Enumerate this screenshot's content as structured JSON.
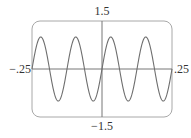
{
  "chart_data": {
    "type": "line",
    "title": "",
    "xlabel": "",
    "ylabel": "",
    "function": "y = sin(16*pi*x)",
    "xlim": [
      -0.25,
      0.25
    ],
    "ylim": [
      -1.5,
      1.5
    ],
    "grid": false,
    "legend": null,
    "tick_labels": {
      "x_min": "−.25",
      "x_max": ".25",
      "y_min": "−1.5",
      "y_max": "1.5"
    },
    "series": [
      {
        "name": "sine wave",
        "amplitude": 1,
        "period": 0.125,
        "cycles_shown": 4,
        "x": [
          -0.25,
          -0.21875,
          -0.1875,
          -0.15625,
          -0.125,
          -0.09375,
          -0.0625,
          -0.03125,
          0,
          0.03125,
          0.0625,
          0.09375,
          0.125,
          0.15625,
          0.1875,
          0.21875,
          0.25
        ],
        "values": [
          0,
          1,
          0,
          -1,
          0,
          1,
          0,
          -1,
          0,
          1,
          0,
          -1,
          0,
          1,
          0,
          -1,
          0
        ]
      }
    ],
    "colors": {
      "frame": "#a8a8a8",
      "axes": "#777777",
      "curve": "#6e6e6e",
      "text": "#333333"
    }
  },
  "labels": {
    "y_max": "1.5",
    "y_min": "−1.5",
    "x_min": "−.25",
    "x_max": ".25"
  }
}
